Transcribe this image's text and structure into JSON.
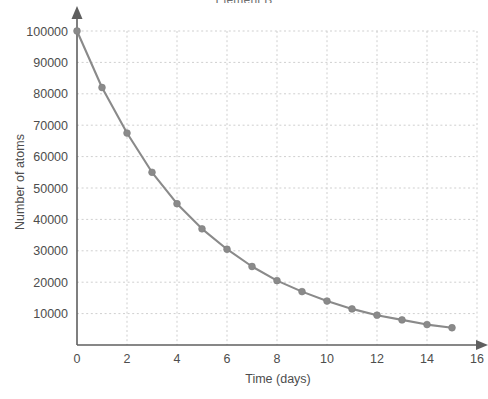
{
  "chart_data": {
    "type": "line",
    "title": "Element B",
    "xlabel": "Time (days)",
    "ylabel": "Number of atoms",
    "x": [
      0,
      1,
      2,
      3,
      4,
      5,
      6,
      7,
      8,
      9,
      10,
      11,
      12,
      13,
      14,
      15
    ],
    "values": [
      100000,
      82000,
      67500,
      55000,
      45000,
      37000,
      30500,
      25000,
      20500,
      17000,
      14000,
      11500,
      9500,
      8000,
      6500,
      5500
    ],
    "series": [
      {
        "name": "Element B",
        "values": [
          100000,
          82000,
          67500,
          55000,
          45000,
          37000,
          30500,
          25000,
          20500,
          17000,
          14000,
          11500,
          9500,
          8000,
          6500,
          5500
        ]
      }
    ],
    "xticks": [
      0,
      2,
      4,
      6,
      8,
      10,
      12,
      14,
      16
    ],
    "xtick_labels": [
      "0",
      "2",
      "4",
      "6",
      "8",
      "10",
      "12",
      "14",
      "16"
    ],
    "yticks": [
      10000,
      20000,
      30000,
      40000,
      50000,
      60000,
      70000,
      80000,
      90000,
      100000
    ],
    "ytick_labels": [
      "10000",
      "20000",
      "30000",
      "40000",
      "50000",
      "60000",
      "70000",
      "80000",
      "90000",
      "100000"
    ],
    "xlim": [
      0,
      16
    ],
    "ylim": [
      0,
      100000
    ],
    "grid": true,
    "legend": "none",
    "marker": "circle",
    "line_color": "#8a8a8a",
    "marker_color": "#8a8a8a",
    "grid_color": "#cfcfcf",
    "axis_color": "#5f5f5f",
    "background_color": "#ffffff"
  }
}
